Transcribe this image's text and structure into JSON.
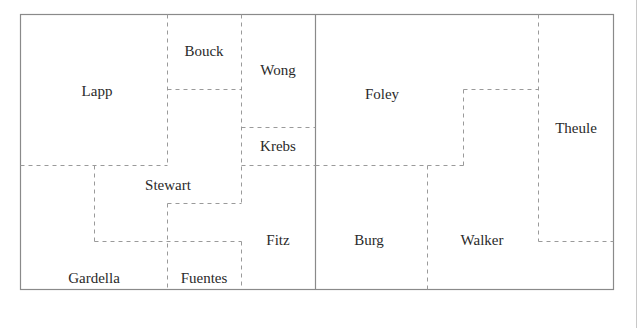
{
  "diagram": {
    "title": "",
    "colors": {
      "border": "#8a8a8a",
      "dashed": "#9a9a9a",
      "text": "#2a2a2a"
    },
    "regions": [
      {
        "name": "Lapp",
        "x": 97,
        "y": 91
      },
      {
        "name": "Bouck",
        "x": 204,
        "y": 51
      },
      {
        "name": "Wong",
        "x": 278,
        "y": 70
      },
      {
        "name": "Krebs",
        "x": 278,
        "y": 146
      },
      {
        "name": "Stewart",
        "x": 168,
        "y": 185
      },
      {
        "name": "Fitz",
        "x": 278,
        "y": 240
      },
      {
        "name": "Gardella",
        "x": 94,
        "y": 278
      },
      {
        "name": "Fuentes",
        "x": 204,
        "y": 278
      },
      {
        "name": "Foley",
        "x": 382,
        "y": 94
      },
      {
        "name": "Theule",
        "x": 576,
        "y": 128
      },
      {
        "name": "Burg",
        "x": 369,
        "y": 240
      },
      {
        "name": "Walker",
        "x": 482,
        "y": 240
      }
    ]
  }
}
